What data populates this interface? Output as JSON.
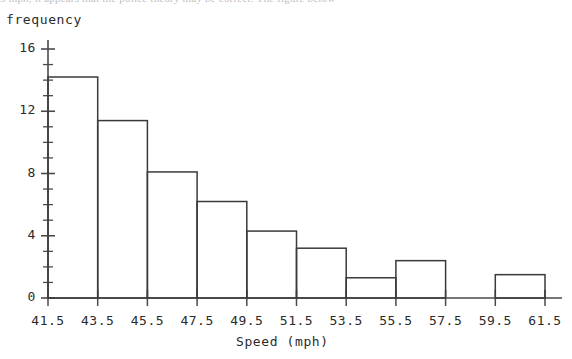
{
  "page": {
    "clipped_top_text": "5 mph, it appears that the police theory may be correct. The figure below"
  },
  "chart_data": {
    "type": "bar",
    "title": "",
    "subtitle": "",
    "xlabel": "Speed (mph)",
    "ylabel": "frequency",
    "categories": [
      "41.5-43.5",
      "43.5-45.5",
      "45.5-47.5",
      "47.5-49.5",
      "49.5-51.5",
      "51.5-53.5",
      "53.5-55.5",
      "55.5-57.5",
      "57.5-59.5",
      "59.5-61.5"
    ],
    "bin_edges": [
      41.5,
      43.5,
      45.5,
      47.5,
      49.5,
      51.5,
      53.5,
      55.5,
      57.5,
      59.5,
      61.5
    ],
    "values": [
      14.2,
      11.4,
      8.1,
      6.2,
      4.3,
      3.2,
      1.3,
      2.4,
      0,
      1.5
    ],
    "x_tick_labels": [
      "41.5",
      "43.5",
      "45.5",
      "47.5",
      "49.5",
      "51.5",
      "53.5",
      "55.5",
      "57.5",
      "59.5",
      "61.5"
    ],
    "y_tick_labels": [
      "0",
      "4",
      "8",
      "12",
      "16"
    ],
    "y_major_ticks": [
      0,
      4,
      8,
      12,
      16
    ],
    "y_minor_tick_step": 1,
    "xlim": [
      41.5,
      61.5
    ],
    "ylim": [
      0,
      16.8
    ],
    "grid": false,
    "legend": null,
    "bar_fill": "none",
    "bar_stroke": "#3a3a3a",
    "axis_color": "#4a4a4a"
  }
}
